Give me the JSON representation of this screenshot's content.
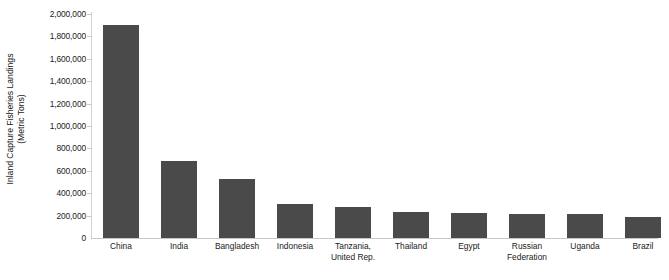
{
  "chart_data": {
    "type": "bar",
    "title": "",
    "xlabel": "",
    "ylabel": "Inland Capture Fisheries Landings (Metric Tons)",
    "ylabel_lines": [
      "Inland Capture Fisheries Landings",
      "(Metric Tons)"
    ],
    "categories": [
      "China",
      "India",
      "Bangladesh",
      "Indonesia",
      "Tanzania, United Rep.",
      "Thailand",
      "Egypt",
      "Russian Federation",
      "Uganda",
      "Brazil"
    ],
    "category_label_lines": [
      [
        "China"
      ],
      [
        "India"
      ],
      [
        "Bangladesh"
      ],
      [
        "Indonesia"
      ],
      [
        "Tanzania,",
        "United Rep."
      ],
      [
        "Thailand"
      ],
      [
        "Egypt"
      ],
      [
        "Russian",
        "Federation"
      ],
      [
        "Uganda"
      ],
      [
        "Brazil"
      ]
    ],
    "values": [
      1900000,
      690000,
      530000,
      300000,
      280000,
      230000,
      225000,
      215000,
      210000,
      185000
    ],
    "ylim": [
      0,
      2000000
    ],
    "ytick_values": [
      2000000,
      1800000,
      1600000,
      1400000,
      1200000,
      1000000,
      800000,
      600000,
      400000,
      200000,
      0
    ],
    "ytick_labels": [
      "2,000,000",
      "1,800,000",
      "1,600,000",
      "1,400,000",
      "1,200,000",
      "1,000,000",
      "800,000",
      "600,000",
      "400,000",
      "200,000",
      "0"
    ],
    "grid": false,
    "legend": null,
    "legend_position": "none",
    "bar_color": "#4a4a4a",
    "axis_color": "#c8c8c8",
    "background_color": "#ffffff"
  }
}
